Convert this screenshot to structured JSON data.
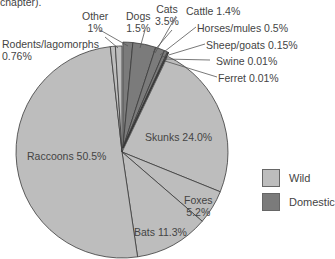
{
  "chart_data": {
    "type": "pie",
    "title": "",
    "caption_fragment": "chapter).",
    "start_angle_deg": 0,
    "direction": "clockwise",
    "slices": [
      {
        "label": "Dogs",
        "value": 1.5,
        "display": "1.5%",
        "group": "Domestic"
      },
      {
        "label": "Cats",
        "value": 3.5,
        "display": "3.5%",
        "group": "Domestic"
      },
      {
        "label": "Cattle",
        "value": 1.4,
        "display": "1.4%",
        "group": "Domestic"
      },
      {
        "label": "Horses/mules",
        "value": 0.5,
        "display": "0.5%",
        "group": "Domestic"
      },
      {
        "label": "Sheep/goats",
        "value": 0.15,
        "display": "0.15%",
        "group": "Domestic"
      },
      {
        "label": "Swine",
        "value": 0.01,
        "display": "0.01%",
        "group": "Domestic"
      },
      {
        "label": "Ferret",
        "value": 0.01,
        "display": "0.01%",
        "group": "Domestic"
      },
      {
        "label": "Skunks",
        "value": 24.0,
        "display": "24.0%",
        "group": "Wild"
      },
      {
        "label": "Foxes",
        "value": 5.2,
        "display": "5.2%",
        "group": "Wild"
      },
      {
        "label": "Bats",
        "value": 11.3,
        "display": "11.3%",
        "group": "Wild"
      },
      {
        "label": "Raccoons",
        "value": 50.5,
        "display": "50.5%",
        "group": "Wild"
      },
      {
        "label": "Rodents/lagomorphs",
        "value": 0.76,
        "display": "0.76%",
        "group": "Wild"
      },
      {
        "label": "Other",
        "value": 1,
        "display": "1%",
        "group": "Wild"
      }
    ],
    "legend": [
      {
        "label": "Wild",
        "color": "#bdbdbd"
      },
      {
        "label": "Domestic",
        "color": "#7b7b7b"
      }
    ],
    "legend_position": "right",
    "exploded_group": "Domestic"
  },
  "labels": {
    "caption": "chapter).",
    "other": [
      "Other",
      "1%"
    ],
    "dogs": [
      "Dogs",
      "1.5%"
    ],
    "cats": [
      "Cats",
      "3.5%"
    ],
    "cattle": "Cattle 1.4%",
    "horses": "Horses/mules 0.5%",
    "sheep": "Sheep/goats 0.15%",
    "swine": "Swine 0.01%",
    "ferret": "Ferret 0.01%",
    "rodents": [
      "Rodents/lagomorphs",
      "0.76%"
    ],
    "skunks": "Skunks 24.0%",
    "raccoons": "Raccoons 50.5%",
    "foxes": [
      "Foxes",
      "5.2%"
    ],
    "bats": "Bats 11.3%"
  },
  "legend": {
    "wild": "Wild",
    "domestic": "Domestic"
  }
}
